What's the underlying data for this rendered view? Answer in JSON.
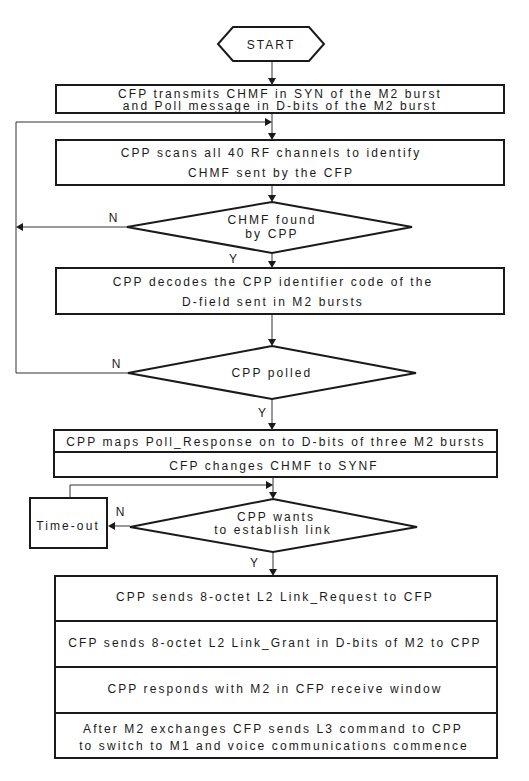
{
  "flowchart": {
    "start": {
      "label": "START"
    },
    "steps": {
      "transmit": {
        "lines": [
          "CFP transmits CHMF in SYN of the M2 burst",
          "and Poll message in D-bits of the M2 burst"
        ]
      },
      "scan": {
        "lines": [
          "CPP scans all 40 RF channels to identify",
          "CHMF sent by the CFP"
        ]
      },
      "decode": {
        "lines": [
          "CPP decodes the CPP identifier code of the",
          "D-field sent in M2 bursts"
        ]
      },
      "poll_response": {
        "row1": "CPP maps Poll_Response on to D-bits of three M2 bursts",
        "row2": "CFP changes CHMF to SYNF"
      },
      "timeout": {
        "label": "Time-out"
      },
      "link_sequence": [
        {
          "lines": [
            "CPP sends 8-octet L2 Link_Request to CFP"
          ]
        },
        {
          "lines": [
            "CFP sends 8-octet L2 Link_Grant in D-bits of M2 to CPP"
          ]
        },
        {
          "lines": [
            "CPP responds with M2 in CFP receive window"
          ]
        },
        {
          "lines": [
            "After M2 exchanges CFP sends L3 command to CPP",
            "to switch to M1 and voice communications commence"
          ]
        }
      ]
    },
    "decisions": {
      "chmf_found": {
        "lines": [
          "CHMF found",
          "by CPP"
        ],
        "yes_label": "Y",
        "no_label": "N"
      },
      "cpp_polled": {
        "lines": [
          "CPP polled"
        ],
        "yes_label": "Y",
        "no_label": "N"
      },
      "wants_link": {
        "lines": [
          "CPP wants",
          "to establish link"
        ],
        "yes_label": "Y",
        "no_label": "N"
      }
    }
  }
}
